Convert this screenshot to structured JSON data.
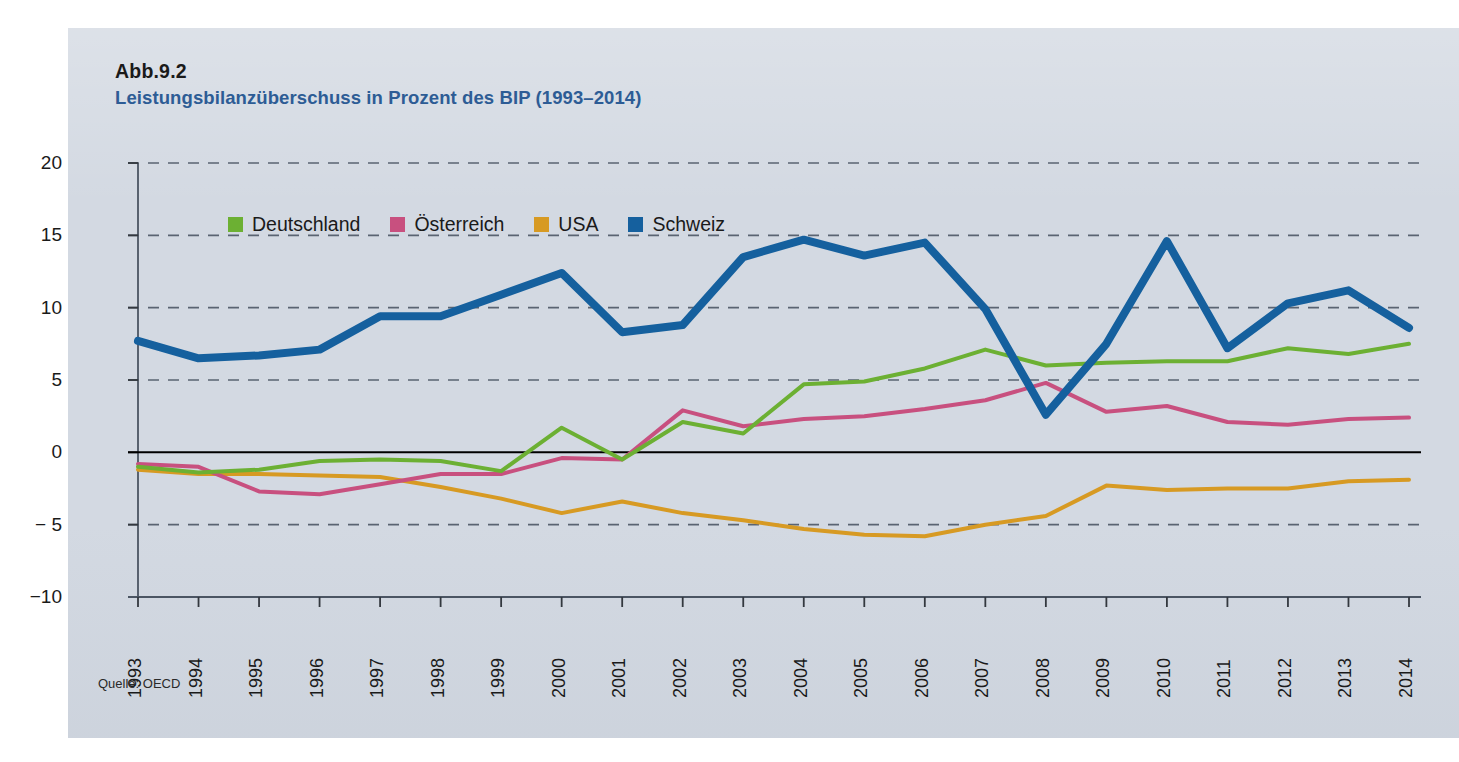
{
  "figure": {
    "number": "Abb.9.2",
    "title": "Leistungsbilanzüberschuss in Prozent des BIP (1993–2014)",
    "source": "Quelle: OECD"
  },
  "colors": {
    "panel_background": "#d3d9e2",
    "title_blue": "#2d5c95",
    "deutschland": "#6cb033",
    "oesterreich": "#c8507f",
    "usa": "#d79a23",
    "schweiz": "#15609e",
    "zero_line": "#000000",
    "gridline": "#5a6472"
  },
  "chart_data": {
    "type": "line",
    "title": "Leistungsbilanzüberschuss in Prozent des BIP (1993–2014)",
    "xlabel": "",
    "ylabel": "",
    "ylim": [
      -10,
      20
    ],
    "yticks": [
      20,
      15,
      10,
      5,
      0,
      -5,
      -10
    ],
    "ytick_labels": [
      "20",
      "15",
      "10",
      "5",
      "0",
      "− 5",
      "−10"
    ],
    "grid": true,
    "legend_position": "top-left-inside",
    "categories": [
      "1993",
      "1994",
      "1995",
      "1996",
      "1997",
      "1998",
      "1999",
      "2000",
      "2001",
      "2002",
      "2003",
      "2004",
      "2005",
      "2006",
      "2007",
      "2008",
      "2009",
      "2010",
      "2011",
      "2012",
      "2013",
      "2014"
    ],
    "series": [
      {
        "name": "Deutschland",
        "color": "#6cb033",
        "values": [
          -1.0,
          -1.4,
          -1.2,
          -0.6,
          -0.5,
          -0.6,
          -1.3,
          1.7,
          -0.5,
          2.1,
          1.3,
          4.7,
          4.9,
          5.8,
          7.1,
          6.0,
          6.2,
          6.3,
          6.3,
          7.2,
          6.8,
          7.5
        ]
      },
      {
        "name": "Österreich",
        "color": "#c8507f",
        "values": [
          -0.8,
          -1.0,
          -2.7,
          -2.9,
          -2.2,
          -1.5,
          -1.5,
          -0.4,
          -0.5,
          2.9,
          1.8,
          2.3,
          2.5,
          3.0,
          3.6,
          4.8,
          2.8,
          3.2,
          2.1,
          1.9,
          2.3,
          2.4
        ]
      },
      {
        "name": "USA",
        "color": "#d79a23",
        "values": [
          -1.2,
          -1.5,
          -1.5,
          -1.6,
          -1.7,
          -2.4,
          -3.2,
          -4.2,
          -3.4,
          -4.2,
          -4.7,
          -5.3,
          -5.7,
          -5.8,
          -5.0,
          -4.4,
          -2.3,
          -2.6,
          -2.5,
          -2.5,
          -2.0,
          -1.9
        ]
      },
      {
        "name": "Schweiz",
        "color": "#15609e",
        "values": [
          7.7,
          6.5,
          6.7,
          7.1,
          9.4,
          9.4,
          10.9,
          12.4,
          8.3,
          8.8,
          13.5,
          14.7,
          13.6,
          14.5,
          9.9,
          2.6,
          7.5,
          14.6,
          7.2,
          10.3,
          11.2,
          8.6
        ]
      }
    ]
  },
  "legend": {
    "items": [
      {
        "label": "Deutschland",
        "color": "#6cb033"
      },
      {
        "label": "Österreich",
        "color": "#c8507f"
      },
      {
        "label": "USA",
        "color": "#d79a23"
      },
      {
        "label": "Schweiz",
        "color": "#15609e"
      }
    ]
  }
}
